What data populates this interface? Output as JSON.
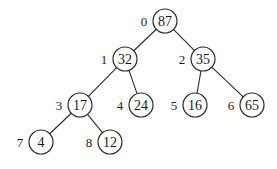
{
  "diagram": {
    "type": "binary-heap-tree",
    "nodes": [
      {
        "index": "0",
        "value": "87",
        "x": 165,
        "y": 21
      },
      {
        "index": "1",
        "value": "32",
        "x": 125,
        "y": 59
      },
      {
        "index": "2",
        "value": "35",
        "x": 203,
        "y": 59
      },
      {
        "index": "3",
        "value": "17",
        "x": 80,
        "y": 105
      },
      {
        "index": "4",
        "value": "24",
        "x": 141,
        "y": 105
      },
      {
        "index": "5",
        "value": "16",
        "x": 195,
        "y": 105
      },
      {
        "index": "6",
        "value": "65",
        "x": 252,
        "y": 105
      },
      {
        "index": "7",
        "value": "4",
        "x": 41,
        "y": 142
      },
      {
        "index": "8",
        "value": "12",
        "x": 110,
        "y": 142
      }
    ],
    "edges": [
      [
        0,
        1
      ],
      [
        0,
        2
      ],
      [
        1,
        3
      ],
      [
        1,
        4
      ],
      [
        2,
        5
      ],
      [
        2,
        6
      ],
      [
        3,
        7
      ],
      [
        3,
        8
      ]
    ],
    "node_radius": 12
  }
}
